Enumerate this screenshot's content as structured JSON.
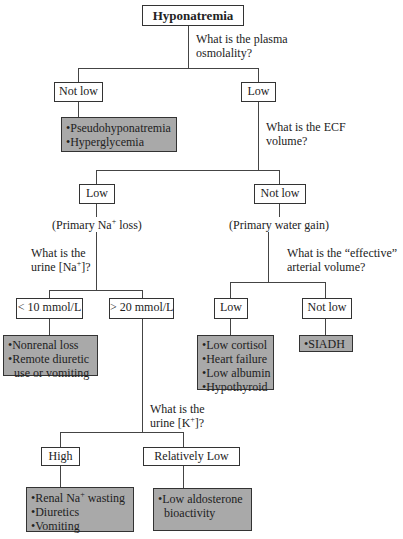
{
  "diagram": {
    "title": "Hyponatremia",
    "q1": {
      "line1": "What is the plasma",
      "line2": "osmolality?"
    },
    "osm_not_low": "Not low",
    "osm_low": "Low",
    "osm_not_low_causes": [
      "Pseudohyponatremia",
      "Hyperglycemia"
    ],
    "q2": {
      "line1": "What is the ECF",
      "line2": "volume?"
    },
    "ecf_low": "Low",
    "ecf_not_low": "Not low",
    "ecf_low_note": {
      "pre": "(Primary Na",
      "sup": "+",
      "post": " loss)"
    },
    "ecf_not_low_note": "(Primary water gain)",
    "q3": {
      "line1": "What is the",
      "line2_pre": "urine [Na",
      "line2_sup": "+",
      "line2_post": "]?"
    },
    "q4": {
      "line1": "What is the “effective”",
      "line2": "arterial volume?"
    },
    "una_low": "< 10 mmol/L",
    "una_high": "> 20 mmol/L",
    "una_low_causes": [
      "Nonrenal loss",
      "Remote diuretic",
      "use or vomiting"
    ],
    "eav_low": "Low",
    "eav_not_low": "Not low",
    "eav_low_causes": [
      "Low cortisol",
      "Heart failure",
      "Low albumin",
      "Hypothyroid"
    ],
    "eav_not_low_causes": [
      "SIADH"
    ],
    "q5": {
      "line1": "What is the",
      "line2_pre": "urine [K",
      "line2_sup": "+",
      "line2_post": "]?"
    },
    "uk_high": "High",
    "uk_low": "Relatively Low",
    "uk_high_causes": {
      "first_pre": "Renal Na",
      "first_sup": "+",
      "first_post": " wasting",
      "rest": [
        "Diuretics",
        "Vomiting"
      ]
    },
    "uk_low_causes": [
      "Low aldosterone",
      "bioactivity"
    ],
    "colors": {
      "leaf_fill": "#a9a9a9",
      "line": "#444444",
      "border": "#333333"
    }
  }
}
